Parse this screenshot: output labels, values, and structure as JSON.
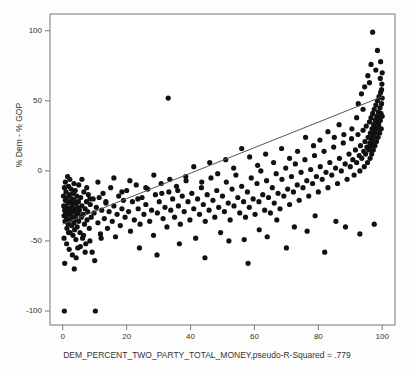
{
  "chart_data": {
    "type": "scatter",
    "title": "",
    "xlabel": "DEM_PERCENT_TWO_PARTY_TOTAL_MONEY,pseudo-R-Squared = .779",
    "ylabel": "% Dem - % GOP",
    "xlim": [
      -4,
      104
    ],
    "ylim": [
      -110,
      112
    ],
    "xticks": [
      0,
      20,
      40,
      60,
      80,
      100
    ],
    "yticks": [
      100,
      50,
      0,
      -50,
      -100
    ],
    "grid": false,
    "legend": null,
    "annotations": [
      {
        "text": "pseudo-R-Squared = .779",
        "where": "x-axis-label-suffix"
      }
    ],
    "fit_line": {
      "type": "linear",
      "x": [
        0,
        100
      ],
      "y": [
        -38.0,
        53.0
      ],
      "color": "#555555"
    },
    "marker": {
      "shape": "circle",
      "color": "#111111",
      "size": 2.6
    },
    "points": [
      [
        0.2,
        -18
      ],
      [
        0.3,
        -25
      ],
      [
        0.4,
        -32
      ],
      [
        0.5,
        -12
      ],
      [
        0.6,
        -28
      ],
      [
        0.7,
        -36
      ],
      [
        0.8,
        -21
      ],
      [
        0.9,
        -30
      ],
      [
        1.0,
        -15
      ],
      [
        1.1,
        -26
      ],
      [
        1.2,
        -34
      ],
      [
        1.3,
        -41
      ],
      [
        1.4,
        -19
      ],
      [
        1.5,
        -29
      ],
      [
        1.6,
        -23
      ],
      [
        1.7,
        -38
      ],
      [
        1.8,
        -11
      ],
      [
        1.9,
        -31
      ],
      [
        2.0,
        -27
      ],
      [
        2.1,
        -17
      ],
      [
        2.2,
        -35
      ],
      [
        2.3,
        -44
      ],
      [
        2.4,
        -22
      ],
      [
        2.5,
        -30
      ],
      [
        2.6,
        -13
      ],
      [
        2.7,
        -26
      ],
      [
        2.8,
        -39
      ],
      [
        2.9,
        -20
      ],
      [
        3.0,
        -33
      ],
      [
        3.1,
        -24
      ],
      [
        3.2,
        -46
      ],
      [
        3.3,
        -16
      ],
      [
        3.4,
        -29
      ],
      [
        3.5,
        -37
      ],
      [
        3.6,
        -21
      ],
      [
        3.7,
        -42
      ],
      [
        3.8,
        -27
      ],
      [
        3.9,
        -14
      ],
      [
        4.0,
        -34
      ],
      [
        4.1,
        -49
      ],
      [
        4.2,
        -23
      ],
      [
        4.3,
        -31
      ],
      [
        4.4,
        -18
      ],
      [
        4.5,
        -40
      ],
      [
        4.6,
        -26
      ],
      [
        4.7,
        -55
      ],
      [
        4.8,
        -30
      ],
      [
        4.9,
        -22
      ],
      [
        5.0,
        -36
      ],
      [
        5.2,
        -28
      ],
      [
        5.4,
        -44
      ],
      [
        5.6,
        -19
      ],
      [
        5.8,
        -33
      ],
      [
        6.0,
        -25
      ],
      [
        6.2,
        -48
      ],
      [
        6.4,
        -31
      ],
      [
        6.6,
        -15
      ],
      [
        6.8,
        -38
      ],
      [
        7.0,
        -27
      ],
      [
        7.2,
        -52
      ],
      [
        7.4,
        -22
      ],
      [
        7.6,
        -35
      ],
      [
        7.8,
        -29
      ],
      [
        8.0,
        -17
      ],
      [
        8.3,
        -41
      ],
      [
        8.6,
        -24
      ],
      [
        8.9,
        -33
      ],
      [
        9.2,
        -58
      ],
      [
        9.5,
        -20
      ],
      [
        9.8,
        -30
      ],
      [
        0.5,
        -100
      ],
      [
        10.2,
        -100
      ],
      [
        10.5,
        -26
      ],
      [
        11.0,
        -37
      ],
      [
        11.4,
        -19
      ],
      [
        11.8,
        -45
      ],
      [
        12.2,
        -28
      ],
      [
        12.6,
        -16
      ],
      [
        13.0,
        -34
      ],
      [
        13.5,
        -23
      ],
      [
        14.0,
        -41
      ],
      [
        14.5,
        -29
      ],
      [
        15.0,
        -12
      ],
      [
        15.5,
        -36
      ],
      [
        16.0,
        -25
      ],
      [
        16.5,
        -47
      ],
      [
        17.0,
        -31
      ],
      [
        17.5,
        -18
      ],
      [
        18.0,
        -39
      ],
      [
        18.5,
        -27
      ],
      [
        19.0,
        -21
      ],
      [
        19.5,
        -33
      ],
      [
        20.0,
        -14
      ],
      [
        20.6,
        -29
      ],
      [
        21.2,
        -43
      ],
      [
        21.8,
        -22
      ],
      [
        22.4,
        -35
      ],
      [
        23.0,
        -10
      ],
      [
        23.6,
        -27
      ],
      [
        24.2,
        -38
      ],
      [
        24.8,
        -19
      ],
      [
        25.4,
        -31
      ],
      [
        26.0,
        -24
      ],
      [
        26.6,
        -13
      ],
      [
        27.2,
        -36
      ],
      [
        27.8,
        -28
      ],
      [
        28.4,
        -46
      ],
      [
        29.0,
        -17
      ],
      [
        29.6,
        -30
      ],
      [
        30.2,
        -22
      ],
      [
        30.8,
        -9
      ],
      [
        31.4,
        -34
      ],
      [
        32.0,
        -26
      ],
      [
        32.6,
        -40
      ],
      [
        33.0,
        52
      ],
      [
        33.2,
        -15
      ],
      [
        33.8,
        -28
      ],
      [
        34.4,
        -20
      ],
      [
        35.0,
        -33
      ],
      [
        35.6,
        -11
      ],
      [
        36.2,
        -25
      ],
      [
        36.8,
        -38
      ],
      [
        37.4,
        -18
      ],
      [
        38.0,
        -29
      ],
      [
        38.6,
        -7
      ],
      [
        39.2,
        -22
      ],
      [
        39.8,
        -35
      ],
      [
        40.4,
        -16
      ],
      [
        41.0,
        -27
      ],
      [
        41.6,
        -48
      ],
      [
        42.2,
        -20
      ],
      [
        42.8,
        -31
      ],
      [
        43.4,
        -12
      ],
      [
        44.0,
        -24
      ],
      [
        44.6,
        -36
      ],
      [
        45.2,
        -17
      ],
      [
        45.8,
        -28
      ],
      [
        46.4,
        -5
      ],
      [
        47.0,
        -21
      ],
      [
        47.6,
        -33
      ],
      [
        48.2,
        -14
      ],
      [
        48.8,
        -26
      ],
      [
        49.4,
        -44
      ],
      [
        50.0,
        -18
      ],
      [
        50.6,
        -29
      ],
      [
        51.2,
        -8
      ],
      [
        51.8,
        -23
      ],
      [
        52.4,
        -35
      ],
      [
        53.0,
        -13
      ],
      [
        53.6,
        -25
      ],
      [
        54.2,
        -3
      ],
      [
        54.8,
        -19
      ],
      [
        55.4,
        -30
      ],
      [
        56.0,
        -11
      ],
      [
        56.6,
        -22
      ],
      [
        56.8,
        -49
      ],
      [
        57.2,
        -33
      ],
      [
        57.8,
        -15
      ],
      [
        58.4,
        -26
      ],
      [
        59.0,
        -5
      ],
      [
        59.6,
        -20
      ],
      [
        60.2,
        -31
      ],
      [
        60.8,
        -9
      ],
      [
        61.4,
        -22
      ],
      [
        62.0,
        0
      ],
      [
        62.6,
        -17
      ],
      [
        63.2,
        -28
      ],
      [
        63.8,
        -7
      ],
      [
        64.4,
        -19
      ],
      [
        65.0,
        -30
      ],
      [
        65.6,
        -12
      ],
      [
        66.2,
        -23
      ],
      [
        66.8,
        -2
      ],
      [
        67.4,
        -16
      ],
      [
        68.0,
        -27
      ],
      [
        68.6,
        -6
      ],
      [
        69.2,
        -18
      ],
      [
        69.8,
        2
      ],
      [
        70.4,
        -13
      ],
      [
        71.0,
        -24
      ],
      [
        71.6,
        -4
      ],
      [
        72.2,
        -15
      ],
      [
        72.8,
        5
      ],
      [
        73.4,
        -10
      ],
      [
        74.0,
        -21
      ],
      [
        74.6,
        -1
      ],
      [
        75.2,
        -12
      ],
      [
        75.8,
        8
      ],
      [
        76.4,
        -7
      ],
      [
        77.0,
        -18
      ],
      [
        77.6,
        1
      ],
      [
        78.2,
        -9
      ],
      [
        78.8,
        11
      ],
      [
        79.4,
        -4
      ],
      [
        80.0,
        -15
      ],
      [
        80.6,
        3
      ],
      [
        81.2,
        -6
      ],
      [
        81.8,
        14
      ],
      [
        82.4,
        -1
      ],
      [
        83.0,
        -12
      ],
      [
        83.6,
        6
      ],
      [
        84.2,
        -3
      ],
      [
        84.8,
        17
      ],
      [
        85.4,
        2
      ],
      [
        86.0,
        -9
      ],
      [
        86.6,
        9
      ],
      [
        87.2,
        0
      ],
      [
        87.8,
        20
      ],
      [
        88.4,
        5
      ],
      [
        89.0,
        -6
      ],
      [
        89.6,
        12
      ],
      [
        90.0,
        3
      ],
      [
        90.4,
        23
      ],
      [
        90.8,
        8
      ],
      [
        91.2,
        -3
      ],
      [
        91.6,
        15
      ],
      [
        92.0,
        6
      ],
      [
        92.4,
        26
      ],
      [
        92.8,
        11
      ],
      [
        93.0,
        0
      ],
      [
        93.2,
        18
      ],
      [
        93.6,
        9
      ],
      [
        94.0,
        29
      ],
      [
        94.2,
        14
      ],
      [
        94.4,
        3
      ],
      [
        94.6,
        21
      ],
      [
        94.8,
        12
      ],
      [
        95.0,
        32
      ],
      [
        95.2,
        17
      ],
      [
        95.4,
        6
      ],
      [
        95.6,
        24
      ],
      [
        95.8,
        15
      ],
      [
        96.0,
        35
      ],
      [
        96.1,
        20
      ],
      [
        96.2,
        9
      ],
      [
        96.3,
        27
      ],
      [
        96.4,
        18
      ],
      [
        96.5,
        38
      ],
      [
        96.6,
        23
      ],
      [
        96.7,
        12
      ],
      [
        96.8,
        30
      ],
      [
        96.9,
        21
      ],
      [
        97.0,
        41
      ],
      [
        97.1,
        26
      ],
      [
        97.2,
        15
      ],
      [
        97.3,
        33
      ],
      [
        97.4,
        24
      ],
      [
        97.5,
        44
      ],
      [
        97.6,
        29
      ],
      [
        97.7,
        18
      ],
      [
        97.8,
        36
      ],
      [
        97.9,
        27
      ],
      [
        98.0,
        47
      ],
      [
        98.1,
        32
      ],
      [
        98.2,
        21
      ],
      [
        98.3,
        39
      ],
      [
        98.4,
        30
      ],
      [
        98.5,
        50
      ],
      [
        98.6,
        35
      ],
      [
        98.7,
        24
      ],
      [
        98.8,
        42
      ],
      [
        98.9,
        33
      ],
      [
        99.0,
        53
      ],
      [
        99.1,
        38
      ],
      [
        99.2,
        27
      ],
      [
        99.3,
        45
      ],
      [
        99.4,
        36
      ],
      [
        99.5,
        56
      ],
      [
        99.6,
        41
      ],
      [
        99.7,
        30
      ],
      [
        99.8,
        48
      ],
      [
        99.9,
        62
      ],
      [
        100.0,
        39
      ],
      [
        100.0,
        70
      ],
      [
        99.5,
        78
      ],
      [
        98.5,
        86
      ],
      [
        97.0,
        99
      ],
      [
        96.5,
        76
      ],
      [
        95.5,
        68
      ],
      [
        94.5,
        60
      ],
      [
        93.5,
        55
      ],
      [
        92.5,
        48
      ],
      [
        100.0,
        52
      ],
      [
        99.8,
        58
      ],
      [
        99.4,
        66
      ],
      [
        98.0,
        72
      ],
      [
        96.0,
        63
      ],
      [
        94.0,
        44
      ],
      [
        92.0,
        38
      ],
      [
        90.5,
        30
      ],
      [
        88.0,
        26
      ],
      [
        86.5,
        33
      ],
      [
        85.0,
        24
      ],
      [
        83.0,
        28
      ],
      [
        80.5,
        22
      ],
      [
        78.5,
        18
      ],
      [
        76.0,
        24
      ],
      [
        73.5,
        14
      ],
      [
        71.0,
        9
      ],
      [
        68.5,
        16
      ],
      [
        66.0,
        6
      ],
      [
        63.5,
        12
      ],
      [
        61.0,
        4
      ],
      [
        58.5,
        10
      ],
      [
        56.0,
        16
      ],
      [
        53.5,
        2
      ],
      [
        51.0,
        8
      ],
      [
        48.5,
        -2
      ],
      [
        46.0,
        6
      ],
      [
        43.5,
        -8
      ],
      [
        41.0,
        3
      ],
      [
        38.5,
        -4
      ],
      [
        36.0,
        -14
      ],
      [
        33.5,
        -6
      ],
      [
        31.0,
        -16
      ],
      [
        28.5,
        -3
      ],
      [
        26.0,
        -12
      ],
      [
        23.5,
        -20
      ],
      [
        21.0,
        -7
      ],
      [
        18.5,
        -15
      ],
      [
        16.0,
        -5
      ],
      [
        13.5,
        -22
      ],
      [
        11.0,
        -8
      ],
      [
        8.5,
        -20
      ],
      [
        6.0,
        -6
      ],
      [
        3.5,
        -9
      ],
      [
        1.5,
        -4
      ],
      [
        0.8,
        -8
      ],
      [
        2.2,
        -6
      ],
      [
        5.0,
        -10
      ],
      [
        7.5,
        -12
      ],
      [
        0.4,
        -48
      ],
      [
        1.2,
        -52
      ],
      [
        2.0,
        -56
      ],
      [
        3.0,
        -60
      ],
      [
        4.2,
        -62
      ],
      [
        5.5,
        -54
      ],
      [
        7.0,
        -58
      ],
      [
        8.5,
        -50
      ],
      [
        10.0,
        -64
      ],
      [
        12.0,
        -48
      ],
      [
        0.6,
        -66
      ],
      [
        1.8,
        -44
      ],
      [
        3.6,
        -70
      ],
      [
        6.5,
        -46
      ],
      [
        24.0,
        -55
      ],
      [
        29.5,
        -60
      ],
      [
        36.5,
        -52
      ],
      [
        44.5,
        -62
      ],
      [
        52.0,
        -50
      ],
      [
        58.0,
        -66
      ],
      [
        64.0,
        -47
      ],
      [
        70.0,
        -55
      ],
      [
        76.5,
        -43
      ],
      [
        82.0,
        -58
      ],
      [
        88.5,
        -40
      ],
      [
        93.0,
        -45
      ],
      [
        97.5,
        -38
      ],
      [
        85.5,
        -36
      ],
      [
        79.0,
        -32
      ],
      [
        72.5,
        -40
      ],
      [
        67.0,
        -35
      ],
      [
        61.5,
        -42
      ]
    ]
  }
}
